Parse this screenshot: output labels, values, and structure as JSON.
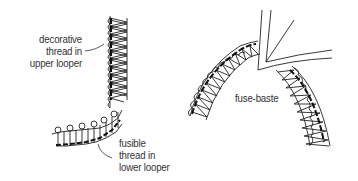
{
  "figures": [
    {
      "id": "left",
      "description": "L-shaped serged edge: vertical column turning into horizontal row",
      "labels": {
        "upper": [
          "decorative",
          "thread in",
          "upper looper"
        ],
        "lower": [
          "fusible",
          "thread in",
          "lower looper"
        ]
      }
    },
    {
      "id": "right",
      "description": "Curved arch of serged stitching with folded edge corner at apex",
      "labels": {
        "center": "fuse-baste"
      }
    }
  ],
  "colors": {
    "line": "#222222",
    "text": "#333333",
    "background": "#ffffff"
  }
}
